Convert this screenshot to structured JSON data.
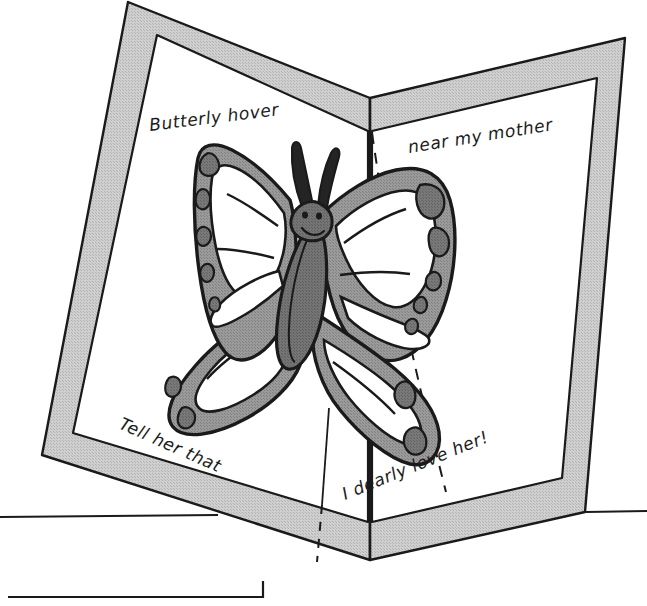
{
  "illustration": {
    "title": "Butterfly pop-up card",
    "subject": "pop-up greeting card with butterfly",
    "background_color": "#ffffff"
  },
  "card": {
    "name": "pop-up-card",
    "border_color": "#c9c9c9",
    "border_shade_color": "#bdbdbd",
    "inner_color": "#ffffff",
    "outline_color": "#1a1a1a",
    "fold_line_style": "dashed",
    "panels": [
      {
        "id": "left-panel",
        "label": "left panel"
      },
      {
        "id": "right-panel",
        "label": "right panel"
      }
    ]
  },
  "verse": {
    "lines": [
      {
        "id": "line-1",
        "text": "Butterly hover",
        "panel": "left-panel",
        "rotation": -7
      },
      {
        "id": "line-2",
        "text": "near my mother",
        "panel": "right-panel",
        "rotation": -9
      },
      {
        "id": "line-3",
        "text": "Tell her that",
        "panel": "left-panel",
        "rotation": 24
      },
      {
        "id": "line-4",
        "text": "I dearly love her!",
        "panel": "right-panel",
        "rotation": -22
      }
    ]
  },
  "butterfly": {
    "name": "pop-up-butterfly",
    "wing_color": "#8f8f8f",
    "wing_cell_color": "#ffffff",
    "spot_color": "#6e6e6e",
    "body_color": "#6b6b6b",
    "body_shade_color": "#5d5d5d",
    "antenna_color": "#242424",
    "outline_color": "#1a1a1a",
    "parts": [
      "left-upper-wing",
      "left-lower-wing",
      "right-upper-wing",
      "right-lower-wing",
      "body",
      "head",
      "left-antenna",
      "right-antenna"
    ]
  },
  "table": {
    "name": "table-edge",
    "line_color": "#1a1a1a",
    "caption_box_visible": true
  }
}
